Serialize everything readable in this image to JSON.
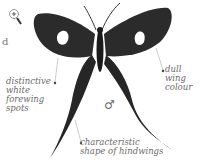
{
  "figure": {
    "sex_symbol": "♂",
    "cut_off_text": "d",
    "zoom_icon": "magnifier-plus-icon"
  },
  "labels": {
    "forewing_spots": "distinctive\nwhite\nforewing\nspots",
    "wing_colour": "dull\nwing\ncolour",
    "hindwings": "characteristic\nshape of hindwings"
  },
  "colors": {
    "wing": "#2a2a2a",
    "spot": "#ffffff",
    "text": "#6a6a6a",
    "leader": "#aaaaaa"
  }
}
